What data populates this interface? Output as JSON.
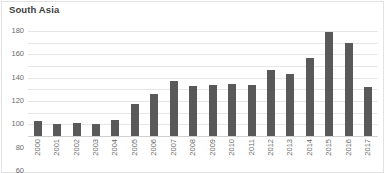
{
  "chart_data": {
    "type": "bar",
    "title": "South Asia",
    "xlabel": "",
    "ylabel": "",
    "ylim": [
      0,
      180
    ],
    "yticks": [
      0,
      20,
      40,
      60,
      80,
      100,
      120,
      140,
      160,
      180
    ],
    "grid": true,
    "legend": "none",
    "bar_color": "#595959",
    "gridline_color": "#e6e6e6",
    "categories": [
      "2000",
      "2001",
      "2002",
      "2003",
      "2004",
      "2005",
      "2006",
      "2007",
      "2008",
      "2009",
      "2010",
      "2011",
      "2012",
      "2013",
      "2014",
      "2015",
      "2016",
      "2017"
    ],
    "values": [
      25,
      20,
      22,
      21,
      28,
      55,
      72,
      95,
      86,
      88,
      89,
      88,
      113,
      107,
      133,
      178,
      160,
      84
    ]
  }
}
